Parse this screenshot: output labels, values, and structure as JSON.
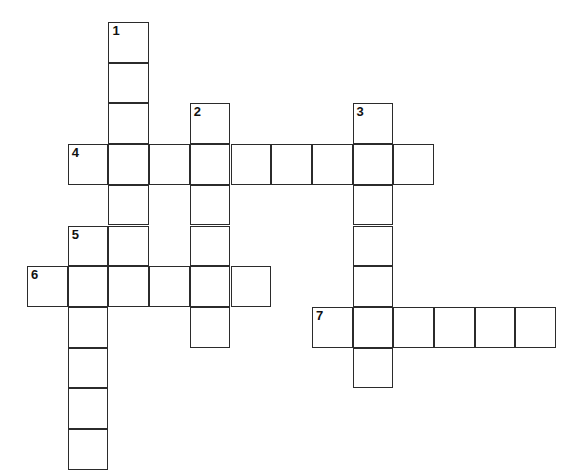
{
  "puzzle": {
    "title": "Crossword Puzzle Grid",
    "background_color": "#ffffff",
    "cell_fill_color": "#ffffff",
    "cell_border_color": "#2b2b2b",
    "number_color": "#111111",
    "cell_size": 40.7,
    "origin_x": 27,
    "origin_y": 22,
    "columns": 13,
    "rows": 11
  },
  "entries": [
    {
      "number": "1",
      "direction": "down",
      "start_col": 2,
      "start_row": 0,
      "length": 6
    },
    {
      "number": "2",
      "direction": "down",
      "start_col": 4,
      "start_row": 2,
      "length": 6
    },
    {
      "number": "3",
      "direction": "down",
      "start_col": 8,
      "start_row": 2,
      "length": 7
    },
    {
      "number": "4",
      "direction": "across",
      "start_col": 1,
      "start_row": 3,
      "length": 9
    },
    {
      "number": "5",
      "direction": "down",
      "start_col": 1,
      "start_row": 5,
      "length": 6
    },
    {
      "number": "6",
      "direction": "across",
      "start_col": 0,
      "start_row": 6,
      "length": 6
    },
    {
      "number": "7",
      "direction": "across",
      "start_col": 7,
      "start_row": 7,
      "length": 6
    }
  ],
  "cells": [
    {
      "col": 2,
      "row": 0,
      "number": "1",
      "letter": ""
    },
    {
      "col": 2,
      "row": 1,
      "number": "",
      "letter": ""
    },
    {
      "col": 2,
      "row": 2,
      "number": "",
      "letter": ""
    },
    {
      "col": 2,
      "row": 3,
      "number": "",
      "letter": ""
    },
    {
      "col": 2,
      "row": 4,
      "number": "",
      "letter": ""
    },
    {
      "col": 2,
      "row": 5,
      "number": "",
      "letter": ""
    },
    {
      "col": 4,
      "row": 2,
      "number": "2",
      "letter": ""
    },
    {
      "col": 4,
      "row": 3,
      "number": "",
      "letter": ""
    },
    {
      "col": 4,
      "row": 4,
      "number": "",
      "letter": ""
    },
    {
      "col": 4,
      "row": 5,
      "number": "",
      "letter": ""
    },
    {
      "col": 4,
      "row": 6,
      "number": "",
      "letter": ""
    },
    {
      "col": 4,
      "row": 7,
      "number": "",
      "letter": ""
    },
    {
      "col": 8,
      "row": 2,
      "number": "3",
      "letter": ""
    },
    {
      "col": 8,
      "row": 3,
      "number": "",
      "letter": ""
    },
    {
      "col": 8,
      "row": 4,
      "number": "",
      "letter": ""
    },
    {
      "col": 8,
      "row": 5,
      "number": "",
      "letter": ""
    },
    {
      "col": 8,
      "row": 6,
      "number": "",
      "letter": ""
    },
    {
      "col": 8,
      "row": 7,
      "number": "",
      "letter": ""
    },
    {
      "col": 8,
      "row": 8,
      "number": "",
      "letter": ""
    },
    {
      "col": 1,
      "row": 3,
      "number": "4",
      "letter": ""
    },
    {
      "col": 3,
      "row": 3,
      "number": "",
      "letter": ""
    },
    {
      "col": 5,
      "row": 3,
      "number": "",
      "letter": ""
    },
    {
      "col": 6,
      "row": 3,
      "number": "",
      "letter": ""
    },
    {
      "col": 7,
      "row": 3,
      "number": "",
      "letter": ""
    },
    {
      "col": 9,
      "row": 3,
      "number": "",
      "letter": ""
    },
    {
      "col": 1,
      "row": 5,
      "number": "5",
      "letter": ""
    },
    {
      "col": 1,
      "row": 6,
      "number": "",
      "letter": ""
    },
    {
      "col": 1,
      "row": 7,
      "number": "",
      "letter": ""
    },
    {
      "col": 1,
      "row": 8,
      "number": "",
      "letter": ""
    },
    {
      "col": 1,
      "row": 9,
      "number": "",
      "letter": ""
    },
    {
      "col": 1,
      "row": 10,
      "number": "",
      "letter": ""
    },
    {
      "col": 0,
      "row": 6,
      "number": "6",
      "letter": ""
    },
    {
      "col": 2,
      "row": 6,
      "number": "",
      "letter": ""
    },
    {
      "col": 3,
      "row": 6,
      "number": "",
      "letter": ""
    },
    {
      "col": 5,
      "row": 6,
      "number": "",
      "letter": ""
    },
    {
      "col": 7,
      "row": 7,
      "number": "7",
      "letter": ""
    },
    {
      "col": 9,
      "row": 7,
      "number": "",
      "letter": ""
    },
    {
      "col": 10,
      "row": 7,
      "number": "",
      "letter": ""
    },
    {
      "col": 11,
      "row": 7,
      "number": "",
      "letter": ""
    },
    {
      "col": 12,
      "row": 7,
      "number": "",
      "letter": ""
    }
  ]
}
